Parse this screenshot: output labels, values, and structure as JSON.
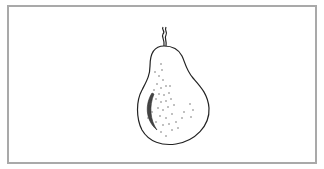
{
  "figure": {
    "colors": {
      "frame_border": "#a9a9a9",
      "line": "#222222",
      "background": "#ffffff"
    }
  }
}
